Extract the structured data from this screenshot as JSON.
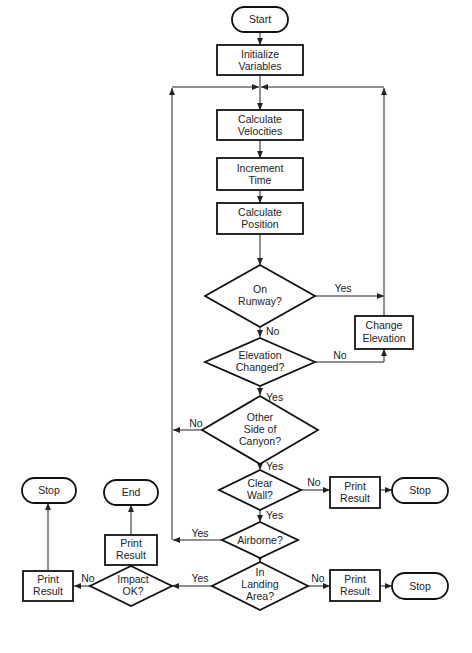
{
  "nodes": {
    "start": {
      "label": "Start"
    },
    "init": {
      "line1": "Initialize",
      "line2": "Variables"
    },
    "velocities": {
      "line1": "Calculate",
      "line2": "Velocities"
    },
    "time": {
      "line1": "Increment",
      "line2": "Time"
    },
    "position": {
      "line1": "Calculate",
      "line2": "Position"
    },
    "on_runway": {
      "line1": "On",
      "line2": "Runway?"
    },
    "change_elev": {
      "line1": "Change",
      "line2": "Elevation"
    },
    "elev_changed": {
      "line1": "Elevation",
      "line2": "Changed?"
    },
    "other_side": {
      "line1": "Other",
      "line2": "Side of",
      "line3": "Canyon?"
    },
    "clear_wall": {
      "line1": "Clear",
      "line2": "Wall?"
    },
    "print1": {
      "line1": "Print",
      "line2": "Result"
    },
    "stop1": {
      "label": "Stop"
    },
    "airborne": {
      "label": "Airborne?"
    },
    "landing": {
      "line1": "In",
      "line2": "Landing",
      "line3": "Area?"
    },
    "print2": {
      "line1": "Print",
      "line2": "Result"
    },
    "stop2": {
      "label": "Stop"
    },
    "impact": {
      "line1": "Impact",
      "line2": "OK?"
    },
    "print3": {
      "line1": "Print",
      "line2": "Result"
    },
    "end": {
      "label": "End"
    },
    "print4": {
      "line1": "Print",
      "line2": "Result"
    },
    "stop3": {
      "label": "Stop"
    }
  },
  "edges": {
    "runway_yes": "Yes",
    "runway_no": "No",
    "elev_no": "No",
    "elev_yes": "Yes",
    "other_no": "No",
    "other_yes": "Yes",
    "wall_no": "No",
    "wall_yes": "Yes",
    "airborne_yes": "Yes",
    "airborne_no": "No",
    "landing_yes": "Yes",
    "landing_no": "No",
    "impact_yes": "Yes",
    "impact_no": "No"
  }
}
